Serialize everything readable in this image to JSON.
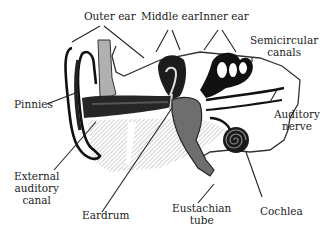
{
  "diagram": {
    "labels": {
      "outer_ear": "Outer ear",
      "middle_ear": "Middle ear",
      "inner_ear": "Inner ear",
      "semicircular_1": "Semicircular",
      "semicircular_2": "canals",
      "pinnies": "Pinnies",
      "auditory_nerve_1": "Auditory",
      "auditory_nerve_2": "nerve",
      "external_canal_1": "External",
      "external_canal_2": "auditory",
      "external_canal_3": "canal",
      "eardrum": "Eardrum",
      "eustachian_1": "Eustachian",
      "eustachian_2": "tube",
      "cochlea": "Cochlea"
    },
    "colors": {
      "ink": "#111111",
      "dark_fill": "#2a2a2a",
      "mid_gray": "#7a7a7a",
      "light_hatch": "#c8c8c8",
      "background": "#ffffff"
    }
  }
}
